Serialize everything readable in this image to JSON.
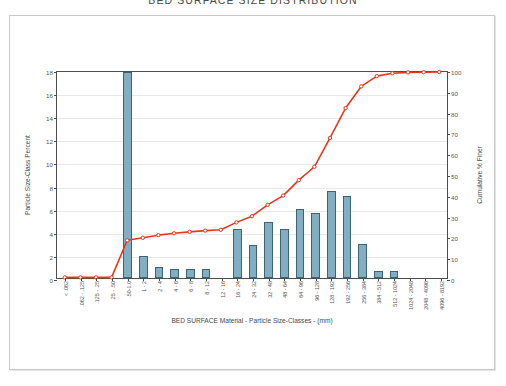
{
  "title": "BED SURFACE SIZE DISTRIBUTION",
  "axes": {
    "left_label": "Particle Size-Class Percent",
    "right_label": "Cumulative % Finer",
    "x_label": "BED SURFACE  Material  -  Particle Size-Classes  -  (mm)"
  },
  "chart_data": {
    "type": "bar",
    "title": "BED SURFACE SIZE DISTRIBUTION",
    "xlabel": "BED SURFACE  Material  -  Particle Size-Classes  -  (mm)",
    "ylabel": "Particle Size-Class Percent",
    "y2label": "Cumulative % Finer",
    "ylim": [
      0,
      18
    ],
    "y2lim": [
      0,
      100
    ],
    "yticks": [
      0,
      2,
      4,
      6,
      8,
      10,
      12,
      14,
      16,
      18
    ],
    "y2ticks": [
      0,
      10,
      20,
      30,
      40,
      50,
      60,
      70,
      80,
      90,
      100
    ],
    "grid": true,
    "legend": "none",
    "categories": [
      "< .062",
      ".062 - .125",
      ".125 - .25",
      ".25 - .50",
      ".50-1.0",
      "1 - 2",
      "2 - 4",
      "4 - 6",
      "6 - 8",
      "8 - 12",
      "12 - 16",
      "16 - 24",
      "24 - 32",
      "32 - 48",
      "48 - 64",
      "64 - 96",
      "96 - 128",
      "128 - 192",
      "192 - 256",
      "256 - 384",
      "384 - 512",
      "512 - 1024",
      "1024 - 2048",
      "2048 - 4096",
      "4096 - 8192"
    ],
    "series": [
      {
        "name": "Particle Size-Class Percent",
        "type": "bar",
        "color": "#82aec4",
        "edge_color": "#3e6372",
        "axis": "left",
        "values": [
          0,
          0,
          0,
          0,
          17.8,
          1.9,
          0.95,
          0.75,
          0.75,
          0.75,
          0,
          4.2,
          2.85,
          4.85,
          4.2,
          5.95,
          5.6,
          7.55,
          7.1,
          2.95,
          0.6,
          0.6,
          0,
          0,
          0
        ]
      },
      {
        "name": "Cumulative % Finer",
        "type": "line",
        "color": "#e8381c",
        "marker": "circle",
        "marker_face": "#ffffff",
        "axis": "right",
        "values": [
          0.3,
          0.3,
          0.3,
          0.3,
          18.3,
          19.5,
          20.8,
          21.7,
          22.4,
          23.0,
          23.4,
          27.0,
          30.0,
          35.5,
          40.0,
          47.5,
          54.0,
          68.0,
          82.5,
          93.0,
          98.0,
          99.4,
          99.8,
          99.9,
          100.0
        ]
      }
    ]
  },
  "colors": {
    "bar_fill": "#82aec4",
    "bar_edge": "#3e6372",
    "line": "#e8381c",
    "axis": "#4d4d4d",
    "grid": "#e8e8e8",
    "frame": "#c9c9c9"
  }
}
